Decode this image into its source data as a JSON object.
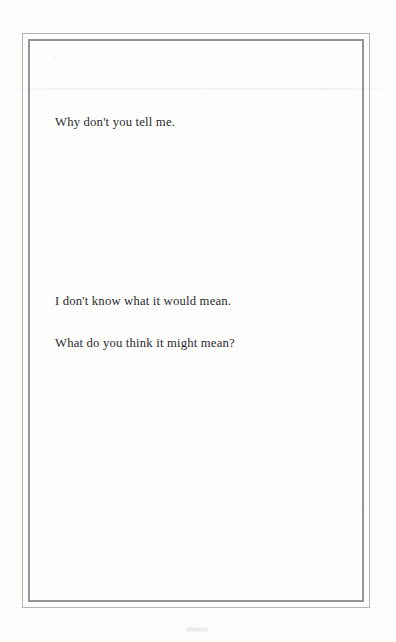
{
  "page": {
    "kind": "scanned-book-page",
    "paper_color": "#fdfdfc",
    "ink_color": "#2b2b2f",
    "border": {
      "style": "double-rule",
      "outer_color": "#b4b4b8",
      "inner_color": "#949498"
    }
  },
  "body": {
    "blocks": [
      {
        "id": "block-1",
        "lines": [
          "Why don't you tell me."
        ]
      },
      {
        "id": "block-2",
        "lines": [
          "I don't know what it would mean.",
          "What do you think it might mean?"
        ]
      }
    ]
  }
}
